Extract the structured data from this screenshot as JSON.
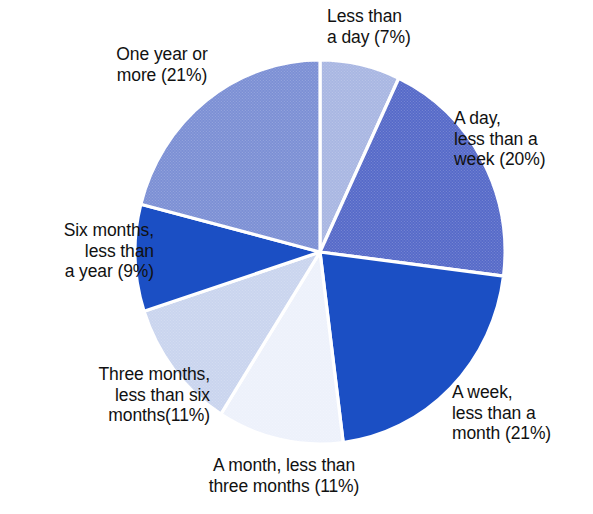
{
  "chart_data": {
    "type": "pie",
    "title": "",
    "subtitle": "",
    "xlabel": "",
    "ylabel": "",
    "legend_position": "none",
    "labels_inline": true,
    "units": "percent",
    "total": 100,
    "start_angle_deg": 0,
    "direction": "clockwise",
    "categories": [
      "Less than a day",
      "A day, less than a week",
      "A week, less than a month",
      "A month, less than three months",
      "Three months, less than six months",
      "Six months, less than a year",
      "One year or more"
    ],
    "values": [
      7,
      20,
      21,
      11,
      11,
      9,
      21
    ],
    "slices": [
      {
        "key": "less-than-a-day",
        "category": "Less than a day",
        "value": 7,
        "percent_text": "(7%)",
        "color": "#A8B6E2",
        "texture": "halftone"
      },
      {
        "key": "a-day-less-week",
        "category": "A day, less than a week",
        "value": 20,
        "percent_text": "(20%)",
        "color": "#5569C8",
        "texture": "halftone"
      },
      {
        "key": "a-week-less-month",
        "category": "A week, less than a month",
        "value": 21,
        "percent_text": "(21%)",
        "color": "#1B4FC4",
        "texture": "solid"
      },
      {
        "key": "a-month-less-three",
        "category": "A month, less than three months",
        "value": 11,
        "percent_text": "(11%)",
        "color": "#EDF1FB",
        "texture": "halftone"
      },
      {
        "key": "three-months-less-six",
        "category": "Three months, less than six months",
        "value": 11,
        "percent_text": "(11%)",
        "color": "#C9D4EE",
        "texture": "halftone"
      },
      {
        "key": "six-months-less-year",
        "category": "Six months, less than a year",
        "value": 9,
        "percent_text": "(9%)",
        "color": "#1B4FC4",
        "texture": "solid"
      },
      {
        "key": "one-year-or-more",
        "category": "One year or more",
        "value": 21,
        "percent_text": "(21%)",
        "color": "#7B8FD4",
        "texture": "halftone"
      }
    ],
    "geometry": {
      "center_x": 320,
      "center_y": 252,
      "radius_x": 185,
      "radius_y": 192,
      "separator_color": "#FFFFFF",
      "separator_width": 3.2
    }
  },
  "labels": {
    "less_than_a_day": "Less than\na day (7%)",
    "a_day_less_than_a_week": "A day,\nless than a\nweek (20%)",
    "a_week_less_than_a_month": "A week,\nless than a\nmonth (21%)",
    "a_month_less_than_three_months": "A month, less than\nthree months (11%)",
    "three_months_less_than_six_months": "Three months,\nless than six\nmonths(11%)",
    "six_months_less_than_a_year": "Six months,\nless than\na year (9%)",
    "one_year_or_more": "One year or\nmore (21%)"
  },
  "colors": {
    "background": "#FFFFFF",
    "text": "#111111",
    "separator": "#FFFFFF",
    "accent_dark": "#1B4FC4",
    "accent_mid": "#5569C8",
    "accent_light": "#A8B6E2"
  }
}
